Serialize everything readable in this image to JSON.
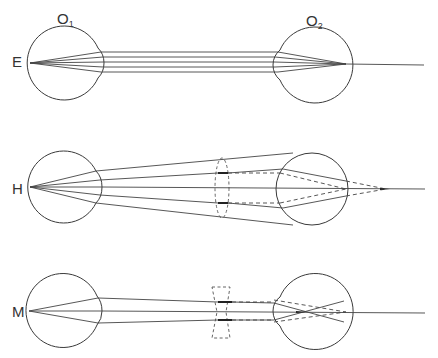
{
  "figure": {
    "observers": {
      "o1": {
        "label": "O",
        "subscript": "1"
      },
      "o2": {
        "label": "O",
        "subscript": "2"
      }
    },
    "rows": [
      {
        "id": "E",
        "label": "E",
        "meaning": "emmetropia",
        "lens": "none",
        "rays": "parallel"
      },
      {
        "id": "H",
        "label": "H",
        "meaning": "hyperopia",
        "lens": "convex (dashed)",
        "rays": "diverging"
      },
      {
        "id": "M",
        "label": "M",
        "meaning": "myopia",
        "lens": "concave (dashed)",
        "rays": "converging"
      }
    ],
    "colors": {
      "line": "#444444",
      "background": "#ffffff"
    }
  }
}
